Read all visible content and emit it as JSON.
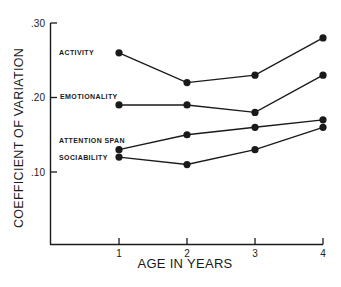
{
  "chart_data": {
    "type": "line",
    "title": "",
    "xlabel": "AGE IN YEARS",
    "ylabel": "COEFFICIENT OF VARIATION",
    "x": [
      1,
      2,
      3,
      4
    ],
    "x_tick_labels": [
      "1",
      "2",
      "3",
      "4"
    ],
    "y_tick_labels": [
      ".10",
      ".20",
      ".30"
    ],
    "y_ticks": [
      0.1,
      0.2,
      0.3
    ],
    "ylim": [
      0.0,
      0.3
    ],
    "grid": false,
    "legend": "inline labels at left of each series",
    "series": [
      {
        "name": "ACTIVITY",
        "values": [
          0.26,
          0.22,
          0.23,
          0.28
        ]
      },
      {
        "name": "EMOTIONALITY",
        "values": [
          0.19,
          0.19,
          0.18,
          0.23
        ]
      },
      {
        "name": "ATTENTION SPAN",
        "values": [
          0.13,
          0.15,
          0.16,
          0.17
        ]
      },
      {
        "name": "SOCIABILITY",
        "values": [
          0.12,
          0.11,
          0.13,
          0.16
        ]
      }
    ]
  },
  "colors": {
    "line": "#1a1a1a",
    "background": "#ffffff"
  }
}
